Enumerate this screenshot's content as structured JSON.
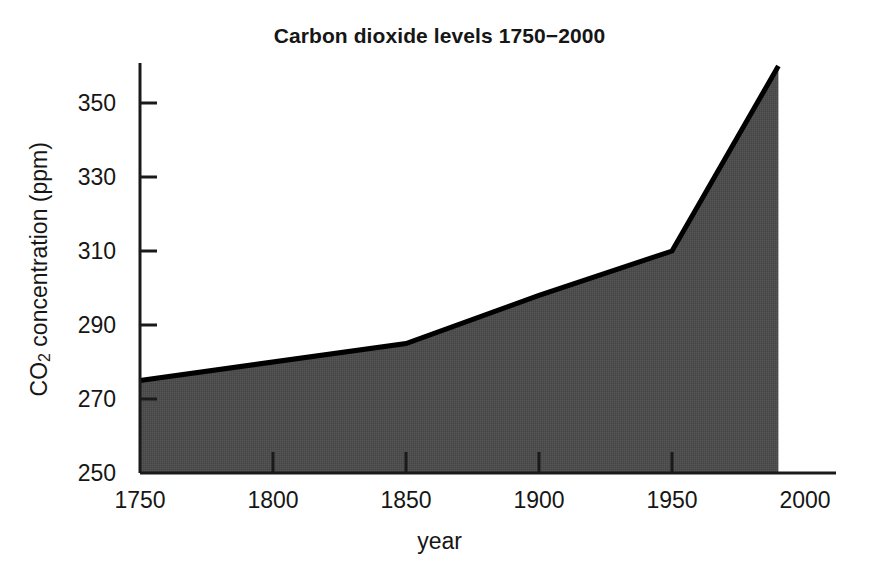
{
  "chart_data": {
    "type": "area",
    "title": "Carbon dioxide levels 1750−2000",
    "xlabel": "year",
    "ylabel": "CO2 concentration (ppm)",
    "ylabel_base": "CO",
    "ylabel_sub": "2",
    "ylabel_rest": " concentration (ppm)",
    "x": [
      1750,
      1850,
      1900,
      1950,
      1990
    ],
    "values": [
      275,
      285,
      298,
      310,
      360
    ],
    "series": [
      {
        "name": "CO2 concentration",
        "points": [
          {
            "x": 1750,
            "y": 275
          },
          {
            "x": 1850,
            "y": 285
          },
          {
            "x": 1900,
            "y": 298
          },
          {
            "x": 1950,
            "y": 310
          },
          {
            "x": 1990,
            "y": 360
          }
        ]
      }
    ],
    "xlim": [
      1750,
      2000
    ],
    "ylim": [
      250,
      360
    ],
    "xticks": [
      1750,
      1800,
      1850,
      1900,
      1950,
      2000
    ],
    "yticks": [
      250,
      270,
      290,
      310,
      330,
      350
    ],
    "xticklabels": [
      "1750",
      "1800",
      "1850",
      "1900",
      "1950",
      "2000"
    ],
    "yticklabels": [
      "250",
      "270",
      "290",
      "310",
      "330",
      "350"
    ],
    "grid": false,
    "legend": false,
    "fill_color": "#4d4d4d",
    "line_color": "#000000",
    "axis_color": "#1a1a1a",
    "background_color": "#ffffff"
  }
}
